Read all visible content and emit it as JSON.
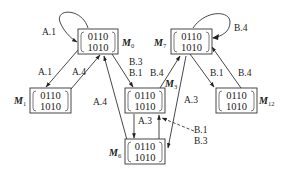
{
  "nodes": [
    {
      "id": "M0",
      "name": "M",
      "sub": "0",
      "row1": "0110",
      "row2": "1010"
    },
    {
      "id": "M7",
      "name": "M",
      "sub": "7",
      "row1": "0110",
      "row2": "1010"
    },
    {
      "id": "M1",
      "name": "M",
      "sub": "1",
      "row1": "0110",
      "row2": "1010"
    },
    {
      "id": "M3",
      "name": "M",
      "sub": "3",
      "row1": "0110",
      "row2": "1010"
    },
    {
      "id": "M12",
      "name": "M",
      "sub": "12",
      "row1": "0110",
      "row2": "1010"
    },
    {
      "id": "M6",
      "name": "M",
      "sub": "6",
      "row1": "0110",
      "row2": "1010"
    }
  ],
  "edges": [
    {
      "from": "M0",
      "to": "M0",
      "label": "A.1",
      "style": "solid"
    },
    {
      "from": "M0",
      "to": "M1",
      "label": "A.1",
      "style": "solid"
    },
    {
      "from": "M1",
      "to": "M0",
      "label": "A.4",
      "style": "solid"
    },
    {
      "from": "M0",
      "to": "M3",
      "label": "B.3 / B.1",
      "style": "solid"
    },
    {
      "from": "M6",
      "to": "M0",
      "label": "A.4",
      "style": "solid"
    },
    {
      "from": "M7",
      "to": "M7",
      "label": "B.4",
      "style": "solid"
    },
    {
      "from": "M3",
      "to": "M7",
      "label": "B.4",
      "style": "solid"
    },
    {
      "from": "M7",
      "to": "M12",
      "label": "B.1",
      "style": "solid"
    },
    {
      "from": "M12",
      "to": "M7",
      "label": "B.4",
      "style": "solid"
    },
    {
      "from": "M7",
      "to": "M6",
      "label": "A.3",
      "style": "solid"
    },
    {
      "from": "M3",
      "to": "M6",
      "label": "A.3",
      "style": "solid"
    },
    {
      "from": "M6",
      "to": "M3",
      "label": "",
      "style": "solid"
    },
    {
      "from": "external",
      "to": "M3",
      "label": "B.1 / B.3",
      "style": "dashed"
    }
  ],
  "labels": {
    "self_M0": "A.1",
    "m0_m1": "A.1",
    "m1_m0": "A.4",
    "m0_m3_a": "B.3",
    "m0_m3_b": "B.1",
    "m6_m0": "A.4",
    "self_M7": "B.4",
    "m3_m7": "B.4",
    "m7_m12": "B.1",
    "m12_m7": "B.4",
    "m7_m6": "A.3",
    "m3_m6": "A.3",
    "ext_a": "B.1",
    "ext_b": "B.3"
  }
}
